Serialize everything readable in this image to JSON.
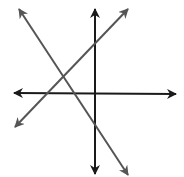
{
  "diagram": {
    "colors": {
      "background": "#ffffff",
      "axis_lines": "#1a1a1a",
      "diagonal_lines": "#555555"
    },
    "lines": [
      {
        "id": "horizontal",
        "x1": 14,
        "y1": 93,
        "x2": 176,
        "y2": 94,
        "color": "#1a1a1a"
      },
      {
        "id": "vertical",
        "x1": 95,
        "y1": 9,
        "x2": 95,
        "y2": 174,
        "color": "#1a1a1a"
      },
      {
        "id": "diagonal-descending",
        "x1": 19,
        "y1": 9,
        "x2": 128,
        "y2": 175,
        "color": "#555555"
      },
      {
        "id": "diagonal-ascending",
        "x1": 15,
        "y1": 127,
        "x2": 128,
        "y2": 9,
        "color": "#555555"
      }
    ]
  }
}
